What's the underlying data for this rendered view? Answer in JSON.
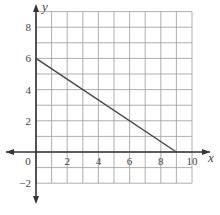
{
  "chart_data": {
    "type": "line",
    "title": "",
    "xlabel": "x",
    "ylabel": "y",
    "xlim": [
      -1,
      10
    ],
    "ylim": [
      -2,
      9
    ],
    "grid": true,
    "x_ticks": [
      0,
      2,
      4,
      6,
      8,
      10
    ],
    "y_ticks": [
      -2,
      2,
      4,
      6,
      8
    ],
    "x_tick_labels": [
      "0",
      "2",
      "4",
      "6",
      "8",
      "10"
    ],
    "y_tick_labels": [
      "−2",
      "2",
      "4",
      "6",
      "8"
    ],
    "series": [
      {
        "name": "line",
        "x": [
          0,
          9
        ],
        "y": [
          6,
          0
        ],
        "color": "#444444"
      }
    ]
  },
  "labels": {
    "x_axis": "x",
    "y_axis": "y",
    "origin": "0"
  }
}
